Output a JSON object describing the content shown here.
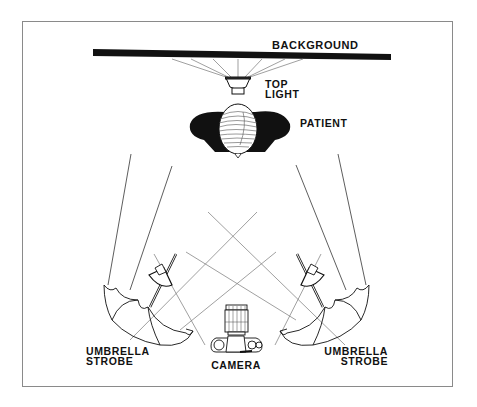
{
  "diagram": {
    "labels": {
      "background": "BACKGROUND",
      "top_light_line1": "TOP",
      "top_light_line2": "LIGHT",
      "patient": "PATIENT",
      "left_strobe_line1": "UMBRELLA",
      "left_strobe_line2": "STROBE",
      "right_strobe_line1": "UMBRELLA",
      "right_strobe_line2": "STROBE",
      "camera": "CAMERA"
    },
    "icons": [
      "background-bar",
      "top-light-icon",
      "patient-head-icon",
      "umbrella-strobe-icon",
      "camera-icon"
    ],
    "colors": {
      "ink": "#111111",
      "frame": "#8a8a8a",
      "light_rays": "#777777"
    }
  }
}
